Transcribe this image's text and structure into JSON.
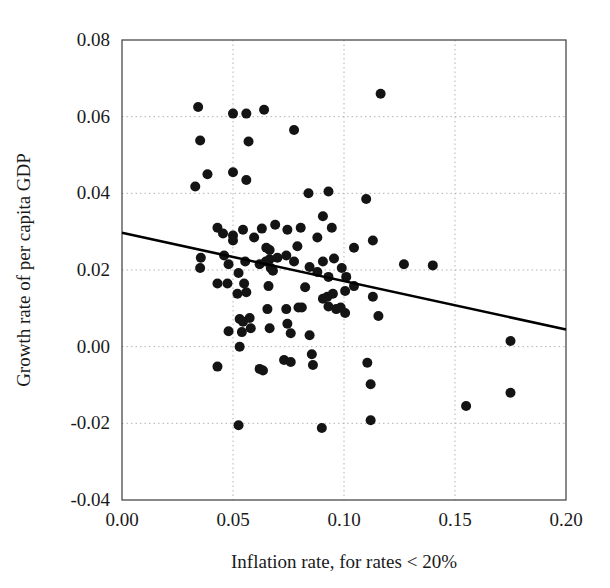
{
  "chart_data": {
    "type": "scatter",
    "title": "",
    "xlabel": "Inflation rate, for rates < 20%",
    "ylabel": "Growth rate of per capita GDP",
    "xlim": [
      0.0,
      0.2
    ],
    "ylim": [
      -0.04,
      0.08
    ],
    "xticks": [
      0.0,
      0.05,
      0.1,
      0.15,
      0.2
    ],
    "xtick_labels": [
      "0.00",
      "0.05",
      "0.10",
      "0.15",
      "0.20"
    ],
    "yticks": [
      -0.04,
      -0.02,
      0.0,
      0.02,
      0.04,
      0.06,
      0.08
    ],
    "ytick_labels": [
      "-0.04",
      "-0.02",
      "0.00",
      "0.02",
      "0.04",
      "0.06",
      "0.08"
    ],
    "grid": true,
    "grid_style": "dotted",
    "grid_color": "#b4b4b4",
    "marker_color": "#141414",
    "marker_size": 5.0,
    "legend": "none",
    "trendline": {
      "label": "fitted regression line",
      "color": "#000000",
      "width": 2.6,
      "x_start": 0.0,
      "y_start": 0.0297,
      "x_end": 0.2,
      "y_end": 0.0045,
      "slope": -0.126,
      "intercept": 0.0297
    },
    "points": [
      {
        "x": 0.0343,
        "y": 0.0625
      },
      {
        "x": 0.0352,
        "y": 0.0538
      },
      {
        "x": 0.033,
        "y": 0.0418
      },
      {
        "x": 0.0385,
        "y": 0.045
      },
      {
        "x": 0.056,
        "y": 0.0608
      },
      {
        "x": 0.05,
        "y": 0.0608
      },
      {
        "x": 0.064,
        "y": 0.0618
      },
      {
        "x": 0.057,
        "y": 0.0535
      },
      {
        "x": 0.0775,
        "y": 0.0565
      },
      {
        "x": 0.1165,
        "y": 0.066
      },
      {
        "x": 0.05,
        "y": 0.0455
      },
      {
        "x": 0.056,
        "y": 0.0435
      },
      {
        "x": 0.084,
        "y": 0.04
      },
      {
        "x": 0.093,
        "y": 0.0405
      },
      {
        "x": 0.11,
        "y": 0.0385
      },
      {
        "x": 0.043,
        "y": 0.031
      },
      {
        "x": 0.0455,
        "y": 0.0295
      },
      {
        "x": 0.05,
        "y": 0.029
      },
      {
        "x": 0.05,
        "y": 0.0277
      },
      {
        "x": 0.0545,
        "y": 0.0305
      },
      {
        "x": 0.063,
        "y": 0.0308
      },
      {
        "x": 0.0595,
        "y": 0.0285
      },
      {
        "x": 0.065,
        "y": 0.0258
      },
      {
        "x": 0.0665,
        "y": 0.0252
      },
      {
        "x": 0.069,
        "y": 0.0318
      },
      {
        "x": 0.0745,
        "y": 0.0305
      },
      {
        "x": 0.0805,
        "y": 0.031
      },
      {
        "x": 0.088,
        "y": 0.0285
      },
      {
        "x": 0.0905,
        "y": 0.034
      },
      {
        "x": 0.0945,
        "y": 0.031
      },
      {
        "x": 0.079,
        "y": 0.0262
      },
      {
        "x": 0.1045,
        "y": 0.0258
      },
      {
        "x": 0.113,
        "y": 0.0277
      },
      {
        "x": 0.0355,
        "y": 0.0232
      },
      {
        "x": 0.0352,
        "y": 0.0205
      },
      {
        "x": 0.046,
        "y": 0.0238
      },
      {
        "x": 0.048,
        "y": 0.0215
      },
      {
        "x": 0.0525,
        "y": 0.0192
      },
      {
        "x": 0.0555,
        "y": 0.0222
      },
      {
        "x": 0.062,
        "y": 0.0215
      },
      {
        "x": 0.0648,
        "y": 0.0222
      },
      {
        "x": 0.0665,
        "y": 0.0228
      },
      {
        "x": 0.067,
        "y": 0.0205
      },
      {
        "x": 0.068,
        "y": 0.0198
      },
      {
        "x": 0.07,
        "y": 0.0232
      },
      {
        "x": 0.074,
        "y": 0.0238
      },
      {
        "x": 0.0775,
        "y": 0.0222
      },
      {
        "x": 0.0845,
        "y": 0.0208
      },
      {
        "x": 0.088,
        "y": 0.0195
      },
      {
        "x": 0.0905,
        "y": 0.0222
      },
      {
        "x": 0.093,
        "y": 0.0182
      },
      {
        "x": 0.0955,
        "y": 0.023
      },
      {
        "x": 0.099,
        "y": 0.0205
      },
      {
        "x": 0.101,
        "y": 0.0182
      },
      {
        "x": 0.127,
        "y": 0.0215
      },
      {
        "x": 0.14,
        "y": 0.0212
      },
      {
        "x": 0.043,
        "y": 0.0165
      },
      {
        "x": 0.0475,
        "y": 0.0165
      },
      {
        "x": 0.052,
        "y": 0.0138
      },
      {
        "x": 0.055,
        "y": 0.0165
      },
      {
        "x": 0.056,
        "y": 0.0142
      },
      {
        "x": 0.066,
        "y": 0.0158
      },
      {
        "x": 0.0825,
        "y": 0.0155
      },
      {
        "x": 0.0905,
        "y": 0.0125
      },
      {
        "x": 0.0925,
        "y": 0.013
      },
      {
        "x": 0.095,
        "y": 0.0138
      },
      {
        "x": 0.1005,
        "y": 0.0145
      },
      {
        "x": 0.1045,
        "y": 0.0158
      },
      {
        "x": 0.113,
        "y": 0.013
      },
      {
        "x": 0.0655,
        "y": 0.0098
      },
      {
        "x": 0.074,
        "y": 0.0098
      },
      {
        "x": 0.0795,
        "y": 0.0102
      },
      {
        "x": 0.081,
        "y": 0.0102
      },
      {
        "x": 0.093,
        "y": 0.0105
      },
      {
        "x": 0.0965,
        "y": 0.0098
      },
      {
        "x": 0.0985,
        "y": 0.0102
      },
      {
        "x": 0.1005,
        "y": 0.0088
      },
      {
        "x": 0.1155,
        "y": 0.008
      },
      {
        "x": 0.175,
        "y": 0.0015
      },
      {
        "x": 0.053,
        "y": 0.0072
      },
      {
        "x": 0.0545,
        "y": 0.0065
      },
      {
        "x": 0.058,
        "y": 0.0048
      },
      {
        "x": 0.0575,
        "y": 0.0075
      },
      {
        "x": 0.0665,
        "y": 0.0048
      },
      {
        "x": 0.054,
        "y": 0.0038
      },
      {
        "x": 0.048,
        "y": 0.004
      },
      {
        "x": 0.0745,
        "y": 0.006
      },
      {
        "x": 0.076,
        "y": 0.0035
      },
      {
        "x": 0.0845,
        "y": 0.003
      },
      {
        "x": 0.053,
        "y": 0.0
      },
      {
        "x": 0.043,
        "y": -0.0052
      },
      {
        "x": 0.073,
        "y": -0.0035
      },
      {
        "x": 0.076,
        "y": -0.004
      },
      {
        "x": 0.0855,
        "y": -0.002
      },
      {
        "x": 0.086,
        "y": -0.0048
      },
      {
        "x": 0.062,
        "y": -0.0058
      },
      {
        "x": 0.0635,
        "y": -0.0062
      },
      {
        "x": 0.1105,
        "y": -0.0042
      },
      {
        "x": 0.112,
        "y": -0.0098
      },
      {
        "x": 0.175,
        "y": -0.012
      },
      {
        "x": 0.155,
        "y": -0.0155
      },
      {
        "x": 0.0525,
        "y": -0.0205
      },
      {
        "x": 0.09,
        "y": -0.0212
      },
      {
        "x": 0.112,
        "y": -0.0192
      }
    ]
  },
  "axes": {
    "frame_color": "#4a4a4a",
    "background": "#ffffff"
  }
}
